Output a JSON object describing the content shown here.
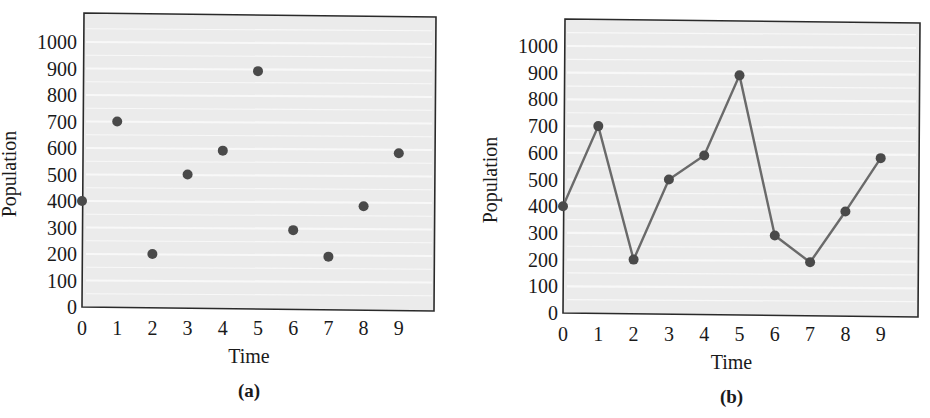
{
  "colors": {
    "plot_background": "#ebebeb",
    "gridline": "#f8f8f8",
    "frame": "#2a2a2a",
    "marker": "#4a4a4a",
    "line": "#6a6a6a",
    "text": "#1a1a1a"
  },
  "chart_data": [
    {
      "id": "a",
      "type": "scatter",
      "caption": "(a)",
      "title": "",
      "xlabel": "Time",
      "ylabel": "Population",
      "x": [
        0,
        1,
        2,
        3,
        4,
        5,
        6,
        7,
        8,
        9
      ],
      "values": [
        400,
        700,
        200,
        500,
        590,
        890,
        290,
        190,
        380,
        580
      ],
      "xticks": [
        "0",
        "1",
        "2",
        "3",
        "4",
        "5",
        "6",
        "7",
        "8",
        "9"
      ],
      "yticks": [
        "0",
        "100",
        "200",
        "300",
        "400",
        "500",
        "600",
        "700",
        "800",
        "900",
        "1000"
      ],
      "xlim": [
        0,
        10
      ],
      "ylim": [
        0,
        1000
      ],
      "grid": true,
      "legend": null,
      "layout": {
        "box": [
          82,
          13,
          436,
          311
        ],
        "x0": 82,
        "dx": 35.2,
        "y0": 307,
        "y1000": 42
      }
    },
    {
      "id": "b",
      "type": "line",
      "caption": "(b)",
      "title": "",
      "xlabel": "Time",
      "ylabel": "Population",
      "x": [
        0,
        1,
        2,
        3,
        4,
        5,
        6,
        7,
        8,
        9
      ],
      "values": [
        400,
        700,
        200,
        500,
        590,
        890,
        290,
        190,
        380,
        580
      ],
      "xticks": [
        "0",
        "1",
        "2",
        "3",
        "4",
        "5",
        "6",
        "7",
        "8",
        "9"
      ],
      "yticks": [
        "0",
        "100",
        "200",
        "300",
        "400",
        "500",
        "600",
        "700",
        "800",
        "900",
        "1000"
      ],
      "xlim": [
        0,
        10
      ],
      "ylim": [
        0,
        1000
      ],
      "grid": true,
      "legend": null,
      "markers": true,
      "layout": {
        "box": [
          98,
          19,
          455,
          317
        ],
        "x0": 98,
        "dx": 35.3,
        "y0": 313,
        "y1000": 46
      }
    }
  ]
}
